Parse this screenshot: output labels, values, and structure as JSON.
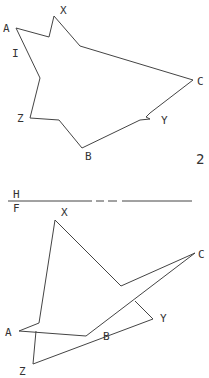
{
  "top_view": {
    "labels": {
      "A": "A",
      "X": "X",
      "I": "I",
      "Z": "Z",
      "C": "C",
      "Y": "Y",
      "B": "B",
      "num": "2"
    }
  },
  "fold_line": {
    "upper": "H",
    "lower": "F"
  },
  "front_view": {
    "labels": {
      "X": "X",
      "C": "C",
      "Y": "Y",
      "B": "B",
      "A": "A",
      "Z": "Z"
    }
  },
  "colors": {
    "line": "#444444",
    "text": "#333333",
    "background": "#ffffff"
  }
}
